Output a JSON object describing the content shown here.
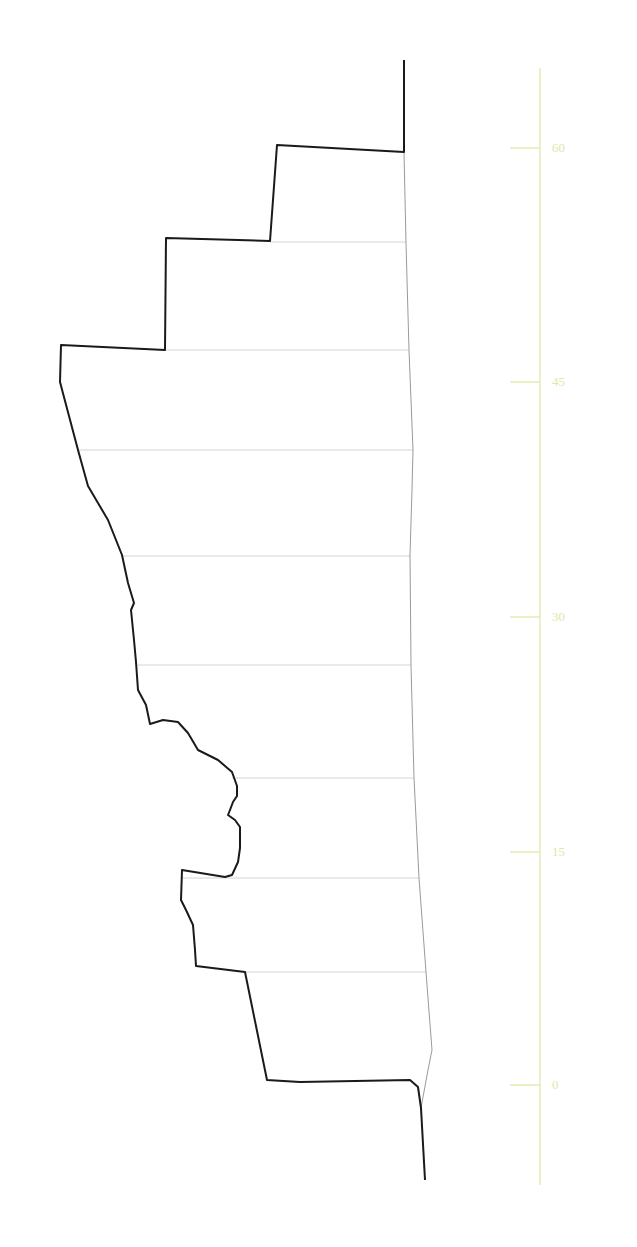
{
  "diagram": {
    "type": "elevation-profile-section",
    "colors": {
      "outline": "#1a1a1a",
      "reference_line": "#9a9a9a",
      "section_lines": "#d4d4d4",
      "axis": "#dfe6a0",
      "axis_label": "#dfe6a8"
    },
    "axis": {
      "orientation": "vertical",
      "x": 540,
      "y_top": 68,
      "y_bottom": 1185,
      "ticks": [
        {
          "value": "60",
          "y": 148
        },
        {
          "value": "45",
          "y": 382
        },
        {
          "value": "30",
          "y": 617
        },
        {
          "value": "15",
          "y": 852
        },
        {
          "value": "0",
          "y": 1085
        }
      ]
    },
    "outline_points": "404,60 404,152 277,145 270,241 166,238 165,350 61,345 60,382 78,450 88,486 108,520 122,555 128,583 134,603 131,610 134,640 136,662 138,690 146,705 150,724 163,720 178,722 188,733 198,750 218,760 232,772 237,786 237,796 233,802 230,810 228,815 235,820 240,827 240,848 238,862 232,875 225,877 182,870 181,900 186,910 193,925 195,950 196,966 245,972 267,1080 300,1082 410,1080 418,1087 421,1108 425,1180",
    "reference_line_points": "404,152 406,243 409,350 413,450 412,490 410,555 411,665 414,778 419,878 426,972 432,1050 428,1070 421,1108",
    "section_lines": [
      {
        "x1": 270,
        "x2": 406,
        "y": 242
      },
      {
        "x1": 165,
        "x2": 409,
        "y": 350
      },
      {
        "x1": 78,
        "x2": 413,
        "y": 450
      },
      {
        "x1": 122,
        "x2": 410,
        "y": 556
      },
      {
        "x1": 138,
        "x2": 411,
        "y": 665
      },
      {
        "x1": 232,
        "x2": 414,
        "y": 778
      },
      {
        "x1": 182,
        "x2": 419,
        "y": 878
      },
      {
        "x1": 245,
        "x2": 426,
        "y": 972
      }
    ]
  }
}
